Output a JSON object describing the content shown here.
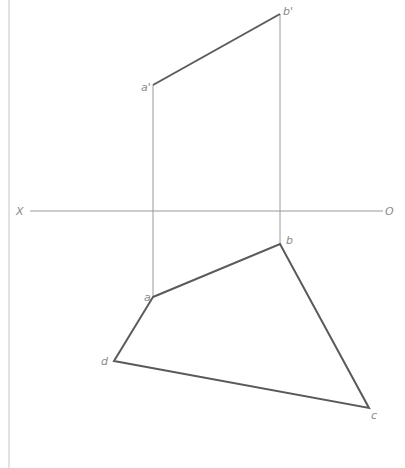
{
  "diagram": {
    "type": "orthographic-projection",
    "axis": {
      "left_label": "X",
      "right_label": "O",
      "y": 211,
      "x1": 30,
      "x2": 383
    },
    "front_view": {
      "points": {
        "a_prime": {
          "label": "a'",
          "x": 153,
          "y": 85
        },
        "b_prime": {
          "label": "b'",
          "x": 280,
          "y": 14
        }
      },
      "edges": [
        [
          "a_prime",
          "b_prime"
        ]
      ]
    },
    "top_view": {
      "points": {
        "a": {
          "label": "a",
          "x": 153,
          "y": 297
        },
        "b": {
          "label": "b",
          "x": 280,
          "y": 244
        },
        "c": {
          "label": "c",
          "x": 369,
          "y": 408
        },
        "d": {
          "label": "d",
          "x": 114,
          "y": 361
        }
      },
      "polygon": [
        "a",
        "b",
        "c",
        "d"
      ]
    },
    "projectors": [
      {
        "from": "a_prime",
        "to": "a"
      },
      {
        "from": "b_prime",
        "to": "b"
      }
    ],
    "colors": {
      "thick_line": "#5a5a5a",
      "thin_line": "#9a9a9a",
      "label": "#8a8a8a",
      "border": "#c8c8c8"
    }
  }
}
